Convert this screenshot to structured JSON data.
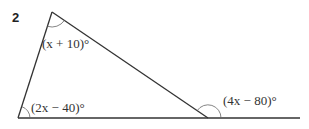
{
  "question_number": "2",
  "diagram": {
    "type": "triangle with exterior angle",
    "vertices": {
      "top": [
        52,
        12
      ],
      "bottom_left": [
        18,
        118
      ],
      "bottom_right": [
        208,
        118
      ]
    },
    "extended_line_end": [
      300,
      118
    ],
    "angles": {
      "top": "(x + 10)°",
      "bottom_left": "(2x − 40)°",
      "exterior": "(4x − 80)°"
    }
  }
}
